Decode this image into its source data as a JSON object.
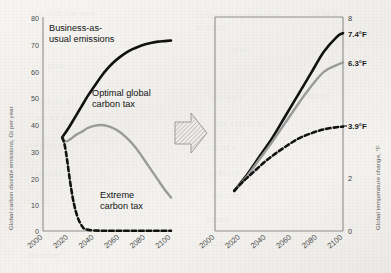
{
  "figure": {
    "background_color": "#f2f1ee",
    "transition_icon": "right-arrow-icon"
  },
  "ghost_text": [
    {
      "t": "an from the an e",
      "x": 34,
      "y": 8
    },
    {
      "t": "to the atmosphere that",
      "x": 196,
      "y": 10
    },
    {
      "t": "ld be a",
      "x": 312,
      "y": 8
    },
    {
      "t": "nt on to",
      "x": 196,
      "y": 22
    },
    {
      "t": "mun",
      "x": 48,
      "y": 60
    },
    {
      "t": "mate",
      "x": 232,
      "y": 44
    },
    {
      "t": "s and the of",
      "x": 30,
      "y": 96
    },
    {
      "t": "ous with",
      "x": 210,
      "y": 92
    },
    {
      "t": "d not be",
      "x": 300,
      "y": 90
    },
    {
      "t": "ies we need",
      "x": 36,
      "y": 112
    },
    {
      "t": "the cost of tr",
      "x": 216,
      "y": 118
    },
    {
      "t": "an emission",
      "x": 24,
      "y": 140
    },
    {
      "t": "ons of a",
      "x": 206,
      "y": 142
    },
    {
      "t": "reduced",
      "x": 210,
      "y": 168
    },
    {
      "t": "l to reduc",
      "x": 30,
      "y": 168
    },
    {
      "t": "the rate",
      "x": 212,
      "y": 190
    },
    {
      "t": "limate",
      "x": 206,
      "y": 214
    },
    {
      "t": "cost of",
      "x": 24,
      "y": 196
    },
    {
      "t": "burden",
      "x": 206,
      "y": 238
    },
    {
      "t": "ble term",
      "x": 28,
      "y": 250
    }
  ],
  "chart_data": [
    {
      "id": "left-chart",
      "type": "line",
      "title": "",
      "xlabel": "",
      "ylabel": "Global carbon dioxide emissions, Gt per year",
      "xlim": [
        2000,
        2100
      ],
      "ylim": [
        0,
        80
      ],
      "xticks": [
        "2000",
        "2020",
        "2040",
        "2060",
        "2080",
        "2100"
      ],
      "yticks": [
        "0",
        "10",
        "20",
        "30",
        "40",
        "50",
        "60",
        "70",
        "80"
      ],
      "grid": false,
      "series": [
        {
          "name": "Business-as-usual emissions",
          "style": "solid",
          "color": "#111111",
          "width": 2.6,
          "x": [
            2015,
            2020,
            2025,
            2030,
            2035,
            2040,
            2045,
            2050,
            2055,
            2060,
            2065,
            2070,
            2075,
            2080,
            2085,
            2090,
            2095,
            2100
          ],
          "y": [
            35,
            38.5,
            42.5,
            46.5,
            50.5,
            54,
            57.5,
            60.5,
            63,
            65,
            66.7,
            68,
            69,
            69.8,
            70.4,
            70.8,
            71,
            71.2
          ]
        },
        {
          "name": "Optimal global carbon tax",
          "style": "solid",
          "color": "#9a9a9a",
          "width": 2.4,
          "x": [
            2015,
            2018,
            2022,
            2026,
            2030,
            2035,
            2040,
            2045,
            2050,
            2055,
            2060,
            2065,
            2070,
            2075,
            2080,
            2085,
            2090,
            2095,
            2100
          ],
          "y": [
            35,
            33.5,
            34.5,
            36,
            37,
            38.5,
            39.3,
            39.6,
            39.3,
            38.4,
            37,
            35,
            32.5,
            29.5,
            26,
            22.5,
            19,
            15.5,
            12.5
          ]
        },
        {
          "name": "Extreme carbon tax",
          "style": "dashed",
          "color": "#111111",
          "width": 2.6,
          "x": [
            2015,
            2017,
            2019,
            2021,
            2023,
            2025,
            2027,
            2029,
            2031,
            2033,
            2040,
            2050,
            2060,
            2070,
            2080,
            2090,
            2100
          ],
          "y": [
            35,
            32,
            26,
            19,
            13,
            8.5,
            5.2,
            3,
            1.5,
            0.7,
            0.2,
            0.1,
            0.1,
            0.1,
            0.1,
            0.1,
            0.1
          ]
        }
      ],
      "annotations": [
        {
          "text": "Business-as-\nusual emissions",
          "x": 2012,
          "y": 76
        },
        {
          "text": "Optimal global\ncarbon tax",
          "x": 2042,
          "y": 52
        },
        {
          "text": "Extreme\ncarbon tax",
          "x": 2048,
          "y": 13
        }
      ]
    },
    {
      "id": "right-chart",
      "type": "line",
      "title": "",
      "xlabel": "",
      "ylabel": "Global temperature change, °F",
      "xlim": [
        2000,
        2100
      ],
      "ylim": [
        0,
        8
      ],
      "xticks": [
        "2000",
        "2020",
        "2040",
        "2060",
        "2080",
        "2100"
      ],
      "yticks": [
        "0",
        "2",
        "8"
      ],
      "value_labels": [
        "7.4°F",
        "6.3°F",
        "3.9°F"
      ],
      "grid": false,
      "series": [
        {
          "name": "Business-as-usual emissions",
          "style": "solid",
          "color": "#111111",
          "width": 2.6,
          "end_label": "7.4°F",
          "x": [
            2015,
            2025,
            2035,
            2045,
            2055,
            2065,
            2075,
            2085,
            2095,
            2100
          ],
          "y": [
            1.5,
            2.1,
            2.8,
            3.5,
            4.3,
            5.1,
            5.9,
            6.7,
            7.25,
            7.4
          ]
        },
        {
          "name": "Optimal global carbon tax",
          "style": "solid",
          "color": "#9a9a9a",
          "width": 2.4,
          "end_label": "6.3°F",
          "x": [
            2015,
            2025,
            2035,
            2045,
            2055,
            2065,
            2075,
            2085,
            2095,
            2100
          ],
          "y": [
            1.5,
            2.05,
            2.7,
            3.35,
            4.05,
            4.75,
            5.4,
            5.95,
            6.2,
            6.3
          ]
        },
        {
          "name": "Extreme carbon tax",
          "style": "dashed",
          "color": "#111111",
          "width": 2.6,
          "end_label": "3.9°F",
          "x": [
            2015,
            2022,
            2030,
            2038,
            2046,
            2055,
            2065,
            2075,
            2085,
            2095,
            2100
          ],
          "y": [
            1.5,
            1.85,
            2.2,
            2.55,
            2.85,
            3.15,
            3.45,
            3.65,
            3.8,
            3.88,
            3.9
          ]
        }
      ]
    }
  ]
}
